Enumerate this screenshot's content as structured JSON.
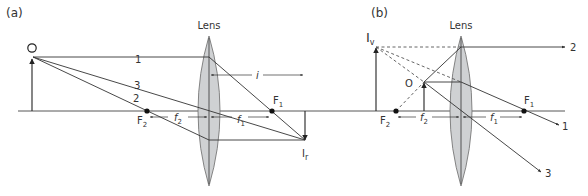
{
  "figure": {
    "panel_a": {
      "label": "(a)",
      "lens_label": "Lens",
      "object_label": "O",
      "image_label": "I",
      "image_sub": "r",
      "focus_near_label": "F",
      "focus_near_sub": "2",
      "focus_far_label": "F",
      "focus_far_sub": "1",
      "dim_f2": "f",
      "dim_f2_sub": "2",
      "dim_f1": "f",
      "dim_f1_sub": "1",
      "dim_image_distance": "i",
      "ray_labels": [
        "1",
        "2",
        "3"
      ]
    },
    "panel_b": {
      "label": "(b)",
      "lens_label": "Lens",
      "object_label": "O",
      "image_label": "I",
      "image_sub": "v",
      "focus_near_label": "F",
      "focus_near_sub": "2",
      "focus_far_label": "F",
      "focus_far_sub": "1",
      "dim_f2": "f",
      "dim_f2_sub": "2",
      "dim_f1": "f",
      "dim_f1_sub": "1",
      "ray_labels": [
        "2",
        "1",
        "3"
      ]
    },
    "colors": {
      "lens_fill": "#cfd1d3",
      "line": "#333333"
    }
  }
}
